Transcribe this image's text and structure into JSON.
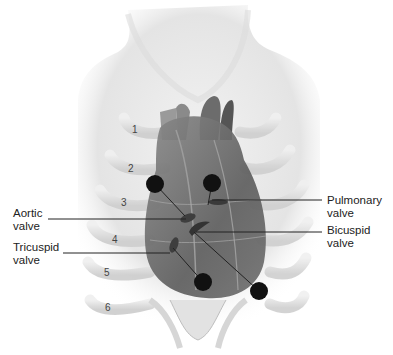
{
  "diagram": {
    "labels": [
      {
        "id": "aortic",
        "text": "Aortic\nvalve",
        "x": 13,
        "y": 207
      },
      {
        "id": "tricuspid",
        "text": "Tricuspid\nvalve",
        "x": 13,
        "y": 241
      },
      {
        "id": "pulmonary",
        "text": "Pulmonary\nvalve",
        "x": 327,
        "y": 194
      },
      {
        "id": "bicuspid",
        "text": "Bicuspid\nvalve",
        "x": 327,
        "y": 224
      }
    ],
    "rib_numbers": [
      "1",
      "2",
      "3",
      "4",
      "5",
      "6"
    ],
    "auscultation_points": [
      {
        "valve": "aortic",
        "x": 155,
        "y": 184
      },
      {
        "valve": "pulmonary",
        "x": 212,
        "y": 183
      },
      {
        "valve": "tricuspid",
        "x": 203,
        "y": 282
      },
      {
        "valve": "bicuspid",
        "x": 259,
        "y": 291
      }
    ],
    "colors": {
      "dot": "#111111",
      "leader": "#222222",
      "skin": "#e6e6e6",
      "heart": "#6a6a6a"
    }
  }
}
